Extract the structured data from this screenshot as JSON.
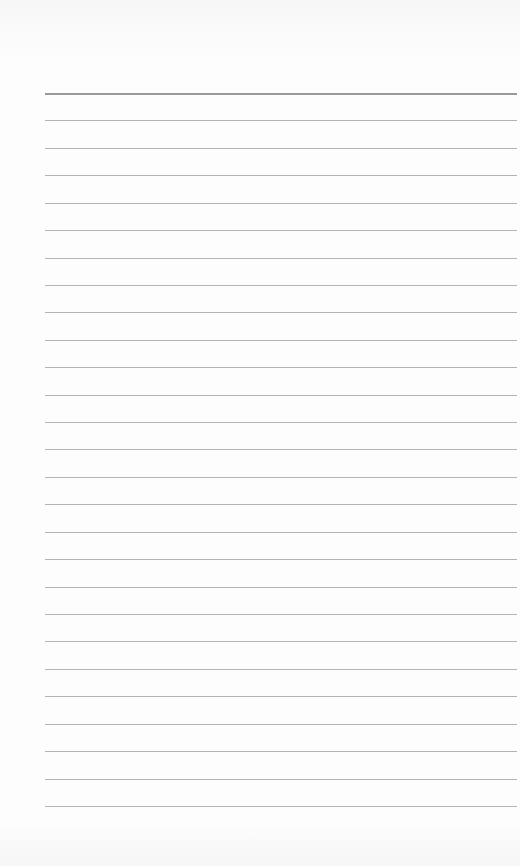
{
  "paper": {
    "type": "lined-notepad",
    "background_color": "#fdfdfd",
    "line_color": "#b4b4b4",
    "top_line_color": "#9a9a9a",
    "line_count": 27,
    "first_line_y": 93,
    "line_spacing": 27.42,
    "line_left": 45,
    "line_right": 517
  }
}
